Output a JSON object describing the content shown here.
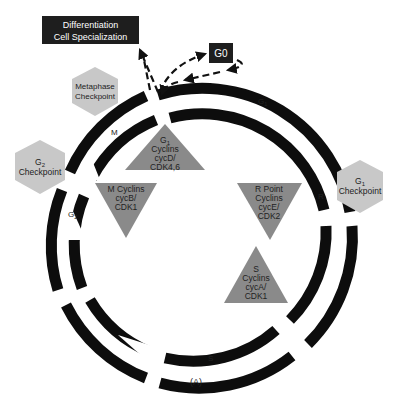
{
  "figure_label": "(A)",
  "boxes": {
    "differentiation": {
      "line1": "Differentiation",
      "line2": "Cell Specialization"
    },
    "g0": "G0"
  },
  "checkpoints": {
    "metaphase": {
      "line1": "Metaphase",
      "line2": "Checkpoint"
    },
    "g2": {
      "line1": "G",
      "sub": "2",
      "line2": "Checkpoint"
    },
    "g1": {
      "line1": "G",
      "sub": "1",
      "line2": "Checkpoint"
    }
  },
  "cyclins": {
    "g1": {
      "line1": "G",
      "sub": "1",
      "line2": "Cyclins",
      "line3": "cycD/",
      "line4": "CDK4,6"
    },
    "m": {
      "line1": "M Cyclins",
      "line2": "cycB/",
      "line3": "CDK1"
    },
    "r": {
      "line1": "R Point",
      "line2": "Cyclins",
      "line3": "cycE/",
      "line4": "CDK2"
    },
    "s": {
      "line1": "S",
      "line2": "Cyclins",
      "line3": "cycA/",
      "line4": "CDK1"
    }
  },
  "phases": {
    "g1": {
      "main": "G",
      "sub": "1"
    },
    "r": "R",
    "s": "S",
    "g2": {
      "main": "G",
      "sub": "2"
    },
    "m": "M"
  },
  "colors": {
    "ring": "#0d0d0d",
    "box": "#1e1e1e",
    "hexagon": "#c8c8c8",
    "triangle": "#8a8a8a"
  }
}
